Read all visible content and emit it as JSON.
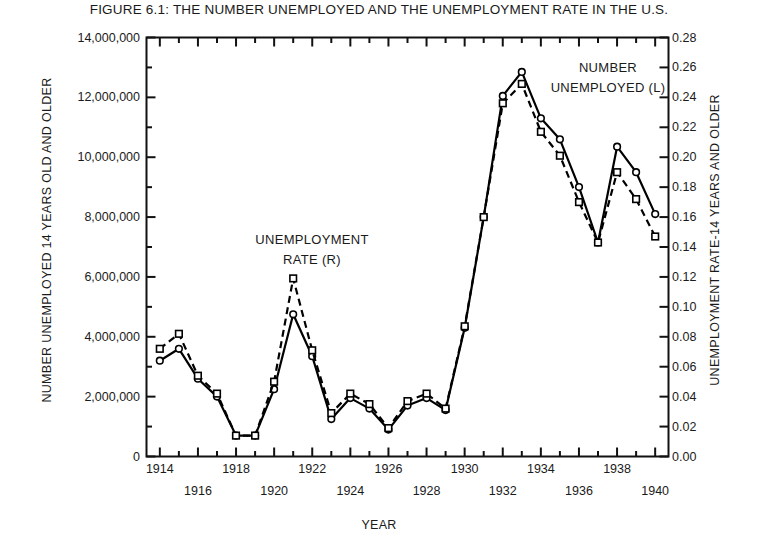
{
  "title": "FIGURE 6.1: THE NUMBER UNEMPLOYED AND THE UNEMPLOYMENT RATE IN THE U.S.",
  "axes": {
    "left_title": "NUMBER UNEMPLOYED 14 YEARS OLD AND OLDER",
    "right_title": "UNEMPLOYMENT RATE-14 YEARS AND OLDER",
    "x_title": "YEAR"
  },
  "annotations": {
    "rate": {
      "line1": "UNEMPLOYMENT",
      "line2": "RATE (R)"
    },
    "number": {
      "line1": "NUMBER",
      "line2": "UNEMPLOYED (L)"
    }
  },
  "chart_data": {
    "type": "line",
    "title": "FIGURE 6.1: THE NUMBER UNEMPLOYED AND THE UNEMPLOYMENT RATE IN THE U.S.",
    "xlabel": "YEAR",
    "ylabel": "NUMBER UNEMPLOYED 14 YEARS OLD AND OLDER",
    "y2label": "UNEMPLOYMENT RATE-14 YEARS AND OLDER",
    "xlim": [
      1913.3,
      1940.7
    ],
    "ylim": [
      0,
      14000000
    ],
    "y2lim": [
      0.0,
      0.28
    ],
    "grid": false,
    "legend": "annotations-inline",
    "x": [
      1914,
      1915,
      1916,
      1917,
      1918,
      1919,
      1920,
      1921,
      1922,
      1923,
      1924,
      1925,
      1926,
      1927,
      1928,
      1929,
      1930,
      1931,
      1932,
      1933,
      1934,
      1935,
      1936,
      1937,
      1938,
      1939,
      1940
    ],
    "y_ticks": [
      0,
      2000000,
      4000000,
      6000000,
      8000000,
      10000000,
      12000000,
      14000000
    ],
    "y_tick_labels": [
      "0",
      "2,000,000",
      "4,000,000",
      "6,000,000",
      "8,000,000",
      "10,000,000",
      "12,000,000",
      "14,000,000"
    ],
    "y2_ticks": [
      0.0,
      0.02,
      0.04,
      0.06,
      0.08,
      0.1,
      0.12,
      0.14,
      0.16,
      0.18,
      0.2,
      0.22,
      0.24,
      0.26,
      0.28
    ],
    "y2_tick_labels": [
      "0.00",
      "0.02",
      "0.04",
      "0.06",
      "0.08",
      "0.10",
      "0.12",
      "0.14",
      "0.16",
      "0.18",
      "0.20",
      "0.22",
      "0.24",
      "0.26",
      "0.28"
    ],
    "x_ticks": [
      1914,
      1916,
      1918,
      1920,
      1922,
      1924,
      1926,
      1928,
      1930,
      1932,
      1934,
      1936,
      1938,
      1940
    ],
    "x_tick_labels_upper": [
      "1914",
      "1918",
      "1922",
      "1926",
      "1930",
      "1934",
      "1938"
    ],
    "x_tick_labels_lower": [
      "1916",
      "1920",
      "1924",
      "1928",
      "1932",
      "1936",
      "1940"
    ],
    "x_ticks_upper": [
      1914,
      1918,
      1922,
      1926,
      1930,
      1934,
      1938
    ],
    "x_ticks_lower": [
      1916,
      1920,
      1924,
      1928,
      1932,
      1936,
      1940
    ],
    "series": [
      {
        "name": "NUMBER UNEMPLOYED (L)",
        "axis": "left",
        "marker": "circle",
        "line_style": "solid",
        "color": "#000000",
        "values": [
          3200000,
          3600000,
          2600000,
          2000000,
          700000,
          700000,
          2250000,
          4750000,
          3350000,
          1250000,
          1950000,
          1600000,
          900000,
          1700000,
          1950000,
          1550000,
          4300000,
          8000000,
          12050000,
          12850000,
          11300000,
          10600000,
          9000000,
          7150000,
          10350000,
          9500000,
          8100000
        ]
      },
      {
        "name": "UNEMPLOYMENT RATE (R)",
        "axis": "right",
        "marker": "square",
        "line_style": "dashed",
        "color": "#000000",
        "values": [
          0.072,
          0.082,
          0.054,
          0.042,
          0.014,
          0.014,
          0.05,
          0.119,
          0.071,
          0.029,
          0.042,
          0.035,
          0.019,
          0.037,
          0.042,
          0.032,
          0.087,
          0.16,
          0.236,
          0.249,
          0.217,
          0.201,
          0.17,
          0.143,
          0.19,
          0.172,
          0.147
        ]
      }
    ]
  }
}
